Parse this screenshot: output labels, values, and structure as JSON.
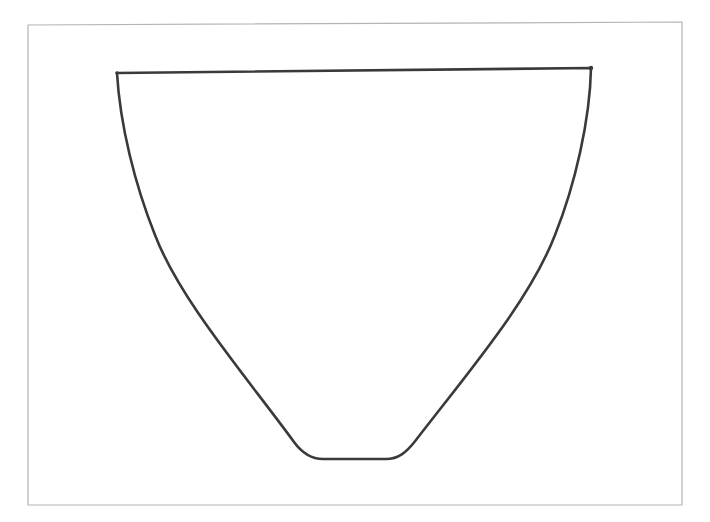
{
  "figure": {
    "colors": {
      "background": "#ffffff",
      "frame_stroke": "#b4b4b4",
      "shape_stroke": "#3a3a3a"
    },
    "frame": {
      "x1": 28,
      "y1": 24,
      "x2": 682,
      "y2": 505
    },
    "shape": {
      "rim_left": [
        117,
        73
      ],
      "rim_right": [
        591,
        68
      ],
      "base_left": [
        323,
        459
      ],
      "base_right": [
        386,
        459
      ],
      "path": "M117,73 L591,68 C590,120 575,185 555,235 C530,300 470,370 416,440 C406,453 398,459 386,459 L323,459 C311,459 302,453 294,442 C245,375 180,300 155,235 C135,185 120,125 117,73 Z"
    }
  }
}
